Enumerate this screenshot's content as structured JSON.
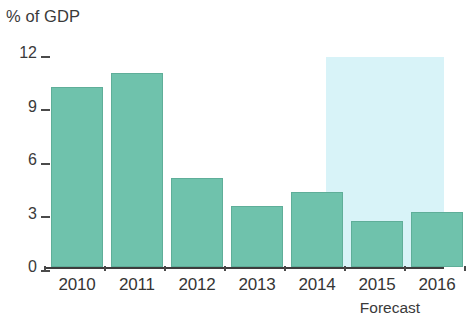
{
  "chart_data": {
    "type": "bar",
    "title": "",
    "subtitle": "",
    "ylabel": "% of GDP",
    "xlabel": "",
    "categories": [
      "2010",
      "2011",
      "2012",
      "2013",
      "2014",
      "2015",
      "2016"
    ],
    "values": [
      10.1,
      10.9,
      5.0,
      3.4,
      4.2,
      2.6,
      3.1
    ],
    "series": [
      {
        "name": "Budget deficit",
        "values": [
          10.1,
          10.9,
          5.0,
          3.4,
          4.2,
          2.6,
          3.1
        ]
      }
    ],
    "ylim": [
      0,
      12
    ],
    "yticks": [
      0,
      3,
      6,
      9,
      12
    ],
    "ytick_labels": [
      "0",
      "3",
      "6",
      "9",
      "12"
    ],
    "grid": false,
    "legend": false,
    "legend_position": "none",
    "annotations": [
      {
        "text": "Forecast",
        "covers_categories": [
          "2015",
          "2016"
        ],
        "type": "shaded-band-caption"
      }
    ],
    "colors": {
      "bar": "#6fc2ac",
      "bar_border": "#5fae99",
      "forecast_band": "#d8f3f8",
      "axis": "#3d3d3d",
      "text": "#353535",
      "background": "#ffffff"
    }
  },
  "labels": {
    "axis_title": "% of GDP",
    "forecast_caption": "Forecast"
  }
}
